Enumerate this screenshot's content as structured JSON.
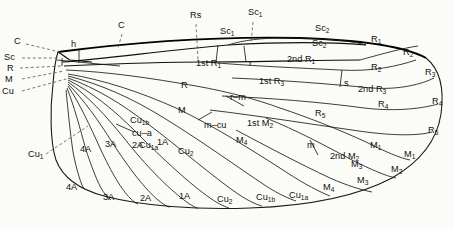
{
  "figure": {
    "background_color": "#fbfbf8",
    "line_color": "#1a1a1a"
  },
  "base_labels": [
    {
      "name": "costa",
      "text": "C",
      "x": 14,
      "y": 44
    },
    {
      "name": "subcosta",
      "text": "Sc",
      "x": 4,
      "y": 60
    },
    {
      "name": "radius",
      "text": "R",
      "x": 7,
      "y": 71
    },
    {
      "name": "media",
      "text": "M",
      "x": 5,
      "y": 82
    },
    {
      "name": "cubitus",
      "text": "Cu",
      "x": 2,
      "y": 94
    }
  ],
  "vein_labels": [
    {
      "name": "costa-mid",
      "text": "C",
      "sub": "",
      "x": 118,
      "y": 28
    },
    {
      "name": "humeral-crossvein",
      "text": "h",
      "sub": "",
      "x": 71,
      "y": 47
    },
    {
      "name": "radial-sector",
      "text": "Rs",
      "sub": "",
      "x": 190,
      "y": 18
    },
    {
      "name": "subcosta-1-upper",
      "text": "Sc",
      "sub": "1",
      "x": 220,
      "y": 34
    },
    {
      "name": "subcosta-1-top",
      "text": "Sc",
      "sub": "1",
      "x": 248,
      "y": 15
    },
    {
      "name": "subcosta-2-top",
      "text": "Sc",
      "sub": "2",
      "x": 315,
      "y": 31
    },
    {
      "name": "subcosta-2-lower",
      "text": "Sc",
      "sub": "2",
      "x": 312,
      "y": 46
    },
    {
      "name": "radius-1-margin",
      "text": "R",
      "sub": "1",
      "x": 371,
      "y": 42
    },
    {
      "name": "radius-2-margin",
      "text": "R",
      "sub": "2",
      "x": 403,
      "y": 55
    },
    {
      "name": "radius-2-cell",
      "text": "R",
      "sub": "2",
      "x": 371,
      "y": 70
    },
    {
      "name": "radius-3-margin",
      "text": "R",
      "sub": "3",
      "x": 425,
      "y": 75
    },
    {
      "name": "radius-4-margin",
      "text": "R",
      "sub": "4",
      "x": 432,
      "y": 104
    },
    {
      "name": "radius-4-cell",
      "text": "R",
      "sub": "4",
      "x": 378,
      "y": 107
    },
    {
      "name": "radius-5-margin",
      "text": "R",
      "sub": "5",
      "x": 428,
      "y": 133
    },
    {
      "name": "radius-5-cell",
      "text": "R",
      "sub": "5",
      "x": 315,
      "y": 116
    },
    {
      "name": "radius-cell",
      "text": "R",
      "sub": "",
      "x": 181,
      "y": 88
    },
    {
      "name": "media-cell",
      "text": "M",
      "sub": "",
      "x": 178,
      "y": 113
    },
    {
      "name": "media-1-cell",
      "text": "M",
      "sub": "1",
      "x": 370,
      "y": 148
    },
    {
      "name": "media-1-margin",
      "text": "M",
      "sub": "1",
      "x": 404,
      "y": 157
    },
    {
      "name": "media-2-margin",
      "text": "M",
      "sub": "2",
      "x": 391,
      "y": 172
    },
    {
      "name": "media-3-cell",
      "text": "M",
      "sub": "3",
      "x": 351,
      "y": 167
    },
    {
      "name": "media-3-margin",
      "text": "M",
      "sub": "3",
      "x": 357,
      "y": 183
    },
    {
      "name": "media-4-cell",
      "text": "M",
      "sub": "4",
      "x": 236,
      "y": 143
    },
    {
      "name": "media-4-margin",
      "text": "M",
      "sub": "4",
      "x": 323,
      "y": 190
    },
    {
      "name": "cubitus-1-base",
      "text": "Cu",
      "sub": "1",
      "x": 28,
      "y": 157
    },
    {
      "name": "cubitus-1a-cell",
      "text": "Cu",
      "sub": "1a",
      "x": 139,
      "y": 148
    },
    {
      "name": "cubitus-1a-margin",
      "text": "Cu",
      "sub": "1a",
      "x": 289,
      "y": 198
    },
    {
      "name": "cubitus-1b-cell",
      "text": "Cu",
      "sub": "1b",
      "x": 130,
      "y": 123
    },
    {
      "name": "cubitus-1b-margin",
      "text": "Cu",
      "sub": "1b",
      "x": 256,
      "y": 200
    },
    {
      "name": "cubitus-2-cell",
      "text": "Cu",
      "sub": "2",
      "x": 178,
      "y": 154
    },
    {
      "name": "cubitus-2-margin",
      "text": "Cu",
      "sub": "2",
      "x": 217,
      "y": 202
    },
    {
      "name": "anal-1-cell",
      "text": "1A",
      "sub": "",
      "x": 157,
      "y": 145
    },
    {
      "name": "anal-1-margin",
      "text": "1A",
      "sub": "",
      "x": 179,
      "y": 199
    },
    {
      "name": "anal-2-cell",
      "text": "2A",
      "sub": "",
      "x": 132,
      "y": 148
    },
    {
      "name": "anal-2-margin",
      "text": "2A",
      "sub": "",
      "x": 140,
      "y": 201
    },
    {
      "name": "anal-3-cell",
      "text": "3A",
      "sub": "",
      "x": 105,
      "y": 147
    },
    {
      "name": "anal-3-margin",
      "text": "3A",
      "sub": "",
      "x": 103,
      "y": 200
    },
    {
      "name": "anal-4-cell",
      "text": "4A",
      "sub": "",
      "x": 80,
      "y": 152
    },
    {
      "name": "anal-4-margin",
      "text": "4A",
      "sub": "",
      "x": 66,
      "y": 190
    }
  ],
  "cell_labels": [
    {
      "name": "first-r1-cell",
      "text": "1st R",
      "sub": "1",
      "x": 196,
      "y": 66
    },
    {
      "name": "r-crossvein",
      "text": "r",
      "sub": "",
      "x": 249,
      "y": 66
    },
    {
      "name": "second-r1-cell",
      "text": "2nd R",
      "sub": "1",
      "x": 287,
      "y": 62
    },
    {
      "name": "first-r3-cell",
      "text": "1st R",
      "sub": "3",
      "x": 259,
      "y": 84
    },
    {
      "name": "s-crossvein",
      "text": "s",
      "sub": "",
      "x": 344,
      "y": 86
    },
    {
      "name": "second-r3-cell",
      "text": "2nd R",
      "sub": "3",
      "x": 358,
      "y": 92
    },
    {
      "name": "rm-crossvein",
      "text": "r–m",
      "sub": "",
      "x": 230,
      "y": 100
    },
    {
      "name": "first-m2-cell",
      "text": "1st M",
      "sub": "2",
      "x": 247,
      "y": 126
    },
    {
      "name": "mcu-crossvein",
      "text": "m–cu",
      "sub": "",
      "x": 204,
      "y": 128
    },
    {
      "name": "m-crossvein",
      "text": "m",
      "sub": "",
      "x": 307,
      "y": 148
    },
    {
      "name": "second-m2-cell",
      "text": "2nd M",
      "sub": "2",
      "x": 330,
      "y": 159
    },
    {
      "name": "cua-crossvein",
      "text": "cu–a",
      "sub": "",
      "x": 132,
      "y": 136
    }
  ]
}
